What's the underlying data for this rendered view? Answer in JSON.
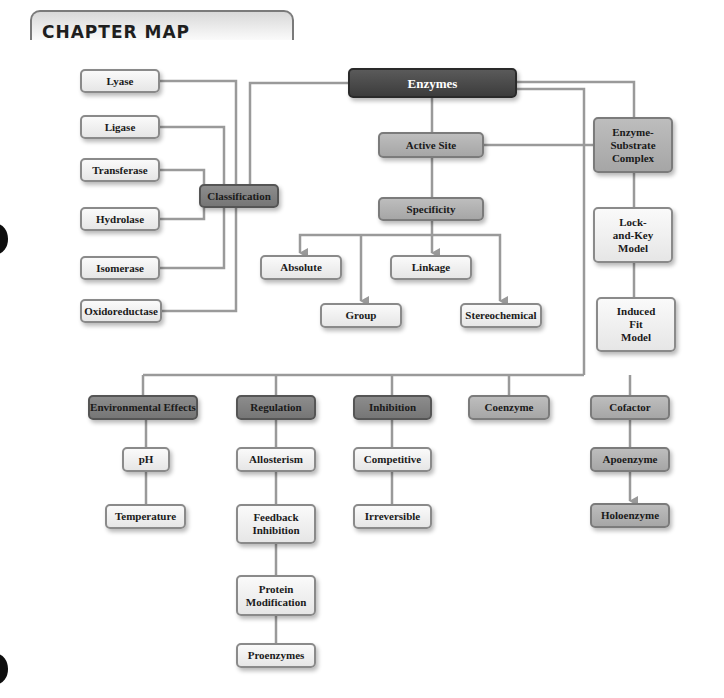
{
  "header": {
    "title": "CHAPTER MAP"
  },
  "colors": {
    "line": "#999999",
    "root": "#454545",
    "dark": "#808080",
    "mid": "#b0b0b0",
    "light": "#eeeeee"
  },
  "nodes": {
    "enzymes": "Enzymes",
    "classification": "Classification",
    "lyase": "Lyase",
    "ligase": "Ligase",
    "transferase": "Transferase",
    "hydrolase": "Hydrolase",
    "isomerase": "Isomerase",
    "oxidoreductase": "Oxidoreductase",
    "active_site": "Active Site",
    "specificity": "Specificity",
    "absolute": "Absolute",
    "linkage": "Linkage",
    "group": "Group",
    "stereochemical": "Stereochemical",
    "es_complex": "Enzyme-Substrate Complex",
    "lock_key": "Lock-and-Key Model",
    "induced_fit": "Induced Fit Model",
    "environmental_effects": "Environmental Effects",
    "ph": "pH",
    "temperature": "Temperature",
    "regulation": "Regulation",
    "allosterism": "Allosterism",
    "feedback_inhibition": "Feedback Inhibition",
    "protein_modification": "Protein Modification",
    "proenzymes": "Proenzymes",
    "inhibition": "Inhibition",
    "competitive": "Competitive",
    "irreversible": "Irreversible",
    "coenzyme": "Coenzyme",
    "cofactor": "Cofactor",
    "apoenzyme": "Apoenzyme",
    "holoenzyme": "Holoenzyme"
  }
}
